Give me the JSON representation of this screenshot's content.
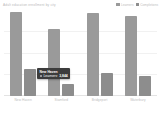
{
  "header": {
    "title": "Adult education enrollment by city",
    "legend": [
      {
        "label": "Learners",
        "color": "#9a9a9a"
      },
      {
        "label": "Completions",
        "color": "#8d8d8d"
      }
    ]
  },
  "tooltip": {
    "title": "New Haven",
    "metric": "Learners:",
    "value": "3,844",
    "swatch_color": "#9a9a9a"
  },
  "chart_data": {
    "type": "bar",
    "title": "Adult education enrollment by city",
    "xlabel": "",
    "ylabel": "",
    "categories": [
      "New Haven",
      "Stamford",
      "Bridgeport",
      "Waterbury"
    ],
    "series": [
      {
        "name": "Learners",
        "color": "#9a9a9a",
        "values": [
          3844,
          3100,
          3800,
          3660
        ]
      },
      {
        "name": "Completions",
        "color": "#8d8d8d",
        "values": [
          1260,
          560,
          1060,
          910
        ]
      }
    ],
    "ylim": [
      0,
      4000
    ],
    "grid": true,
    "gridlines": [
      1000,
      2000,
      3000
    ],
    "legend_position": "top-right",
    "y_tick_labels_visible": false
  }
}
